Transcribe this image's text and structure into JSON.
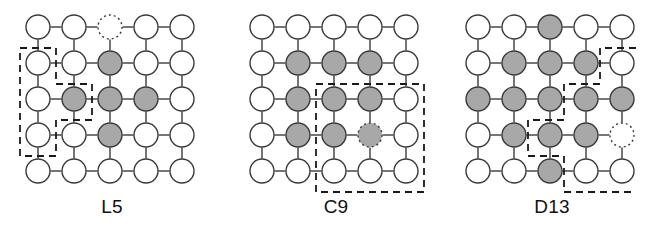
{
  "figure": {
    "width": 664,
    "height": 232,
    "background": "#ffffff"
  },
  "style": {
    "node_radius": 12,
    "node_fill_empty": "#ffffff",
    "node_fill_occupied": "#a8a8a8",
    "node_stroke": "#3a3a3a",
    "node_stroke_width": 1.4,
    "bond_stroke": "#3a3a3a",
    "bond_stroke_width": 1.4,
    "dashed_stroke": "#1a1a1a",
    "dashed_stroke_width": 1.8,
    "dash_pattern": "7,5",
    "ghost_dash_pattern": "2,3",
    "label_color": "#111111",
    "label_font_size": 19
  },
  "lattice": {
    "rows": 5,
    "cols": 5,
    "spacing": 36,
    "origin_x": 38,
    "origin_y": 27
  },
  "panels": [
    {
      "id": "panel-l5",
      "label": "L5",
      "left": 0,
      "grid_offset_x": 0,
      "occupied": [
        [
          3,
          2
        ],
        [
          2,
          3
        ],
        [
          3,
          3
        ],
        [
          4,
          3
        ],
        [
          3,
          4
        ]
      ],
      "ghost_empty": [
        [
          1,
          3
        ]
      ],
      "ghost_occupied": [],
      "boundary_type": "staircase",
      "boundary_points": [
        [
          20,
          48
        ],
        [
          56,
          48
        ],
        [
          56,
          84
        ],
        [
          92,
          84
        ],
        [
          92,
          120
        ],
        [
          56,
          120
        ],
        [
          56,
          156
        ],
        [
          20,
          156
        ],
        [
          20,
          48
        ]
      ]
    },
    {
      "id": "panel-c9",
      "label": "C9",
      "left": 224,
      "grid_offset_x": 0,
      "occupied": [
        [
          2,
          2
        ],
        [
          3,
          2
        ],
        [
          4,
          2
        ],
        [
          2,
          3
        ],
        [
          3,
          3
        ],
        [
          4,
          3
        ],
        [
          2,
          4
        ],
        [
          3,
          4
        ]
      ],
      "ghost_empty": [],
      "ghost_occupied": [
        [
          4,
          4
        ]
      ],
      "boundary_type": "rectangle",
      "boundary_points": [
        [
          92,
          84
        ],
        [
          200,
          84
        ],
        [
          200,
          192
        ],
        [
          92,
          192
        ],
        [
          92,
          84
        ]
      ]
    },
    {
      "id": "panel-d13",
      "label": "D13",
      "left": 440,
      "grid_offset_x": 0,
      "occupied": [
        [
          3,
          1
        ],
        [
          2,
          2
        ],
        [
          3,
          2
        ],
        [
          4,
          2
        ],
        [
          1,
          3
        ],
        [
          2,
          3
        ],
        [
          3,
          3
        ],
        [
          4,
          3
        ],
        [
          5,
          3
        ],
        [
          2,
          4
        ],
        [
          3,
          4
        ],
        [
          4,
          4
        ],
        [
          3,
          5
        ]
      ],
      "ghost_empty": [
        [
          4,
          5
        ]
      ],
      "ghost_occupied": [],
      "boundary_type": "staircase",
      "boundary_points": [
        [
          196,
          48
        ],
        [
          160,
          48
        ],
        [
          160,
          84
        ],
        [
          124,
          84
        ],
        [
          124,
          120
        ],
        [
          88,
          120
        ],
        [
          88,
          156
        ],
        [
          124,
          156
        ],
        [
          124,
          192
        ],
        [
          196,
          192
        ]
      ]
    }
  ]
}
